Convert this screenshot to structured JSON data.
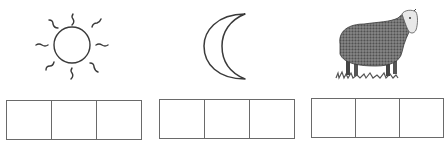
{
  "worksheet": {
    "items": [
      {
        "picture": "sun-icon",
        "label": "sun",
        "boxes": 3
      },
      {
        "picture": "moon-icon",
        "label": "moon",
        "boxes": 3
      },
      {
        "picture": "sheep-icon",
        "label": "sheep",
        "boxes": 3
      }
    ]
  },
  "colors": {
    "line": "#3a3a3a",
    "box_border": "#6a6a6a",
    "background": "#ffffff"
  }
}
